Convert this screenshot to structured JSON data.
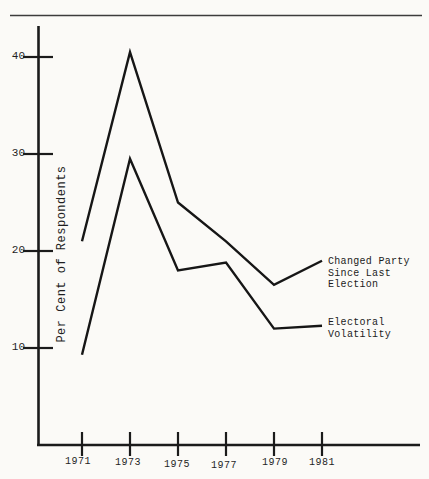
{
  "page": {
    "header_fragment": "1974-83"
  },
  "chart_data": {
    "type": "line",
    "x": [
      1971,
      1973,
      1975,
      1977,
      1979,
      1981
    ],
    "x_tick_labels": [
      "1971",
      "1973",
      "1975",
      "1977",
      "1979",
      "1981"
    ],
    "y_tick_labels": [
      "40",
      "30",
      "20",
      "10"
    ],
    "y_tick_values": [
      40,
      30,
      20,
      10
    ],
    "ylabel": "Per Cent of Respondents",
    "ylim": [
      0,
      43
    ],
    "grid": false,
    "legend_position": "right-inline-labels",
    "series": [
      {
        "name": "Changed Party Since Last Election",
        "label_lines": [
          "Changed Party",
          "Since Last",
          "Election"
        ],
        "values": [
          21,
          40.5,
          25,
          21,
          16.5,
          19
        ]
      },
      {
        "name": "Electoral Volatility",
        "label_lines": [
          "Electoral",
          "Volatility"
        ],
        "values": [
          9.3,
          29.5,
          18,
          18.8,
          12,
          12.3
        ]
      }
    ]
  }
}
